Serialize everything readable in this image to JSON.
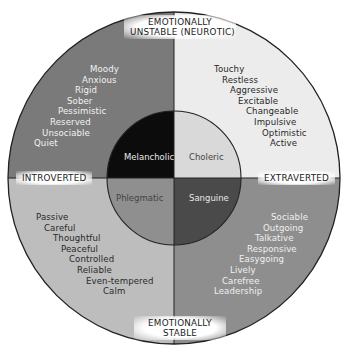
{
  "diagram": {
    "axes": {
      "top": "EMOTIONALLY\nUNSTABLE (NEUROTIC)",
      "top_line1": "EMOTIONALLY",
      "top_line2": "UNSTABLE (NEUROTIC)",
      "bottom_line1": "EMOTIONALLY",
      "bottom_line2": "STABLE",
      "left": "INTROVERTED",
      "right": "EXTRAVERTED"
    },
    "temperaments": {
      "melancholic": "Melancholic",
      "choleric": "Choleric",
      "phlegmatic": "Phlegmatic",
      "sanguine": "Sanguine"
    },
    "traits": {
      "melancholic": [
        "Moody",
        "Anxious",
        "Rigid",
        "Sober",
        "Pessimistic",
        "Reserved",
        "Unsociable",
        "Quiet"
      ],
      "choleric": [
        "Touchy",
        "Restless",
        "Aggressive",
        "Excitable",
        "Changeable",
        "Impulsive",
        "Optimistic",
        "Active"
      ],
      "phlegmatic": [
        "Passive",
        "Careful",
        "Thoughtful",
        "Peaceful",
        "Controlled",
        "Reliable",
        "Even-tempered",
        "Calm"
      ],
      "sanguine": [
        "Sociable",
        "Outgoing",
        "Talkative",
        "Responsive",
        "Easygoing",
        "Lively",
        "Carefree",
        "Leadership"
      ]
    },
    "colors": {
      "outer_top_left": "#7a7a7a",
      "outer_top_right": "#ececec",
      "outer_bottom_left": "#bdbdbd",
      "outer_bottom_right": "#8e8e8e",
      "inner_melancholic": "#0c0c0c",
      "inner_choleric": "#d9d9d9",
      "inner_phlegmatic": "#8f8f8f",
      "inner_sanguine": "#4a4a4a"
    }
  }
}
